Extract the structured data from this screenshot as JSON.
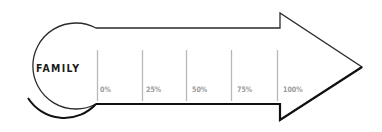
{
  "diagram": {
    "type": "progress-arrow",
    "title": "FAMILY",
    "colors": {
      "outline": "#222222",
      "tick": "#b0b0b0",
      "tick_label": "#9a9a9a",
      "title": "#1a1a1a",
      "fill": "#ffffff"
    },
    "ticks": [
      {
        "label": "0%"
      },
      {
        "label": "25%"
      },
      {
        "label": "50%"
      },
      {
        "label": "75%"
      },
      {
        "label": "100%"
      }
    ]
  }
}
